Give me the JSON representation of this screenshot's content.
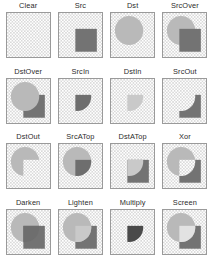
{
  "figure": {
    "columns": 4,
    "rows": 4,
    "colors": {
      "destination_shape": "#b9b9b9",
      "source_shape": "#737373",
      "intersection_dark": "#6e6e6e",
      "intersection_light": "#c9c9c9",
      "multiply_dark": "#4a4a4a",
      "screen_light": "#e2e2e2",
      "checker_light": "#ffffff",
      "checker_dark": "#d9d9d9",
      "cell_border": "#9a9a9a",
      "label_text": "#2b2b2b",
      "background": "#ffffff"
    },
    "geometry": {
      "destination_shape_kind": "circle",
      "destination_cx_pct": 42,
      "destination_cy_pct": 40,
      "destination_r_pct": 33,
      "source_shape_kind": "rect",
      "source_x_pct": 38,
      "source_y_pct": 36,
      "source_w_pct": 50,
      "source_h_pct": 52
    },
    "cells": [
      {
        "label": "Clear",
        "mode": "clear",
        "row": 1,
        "col": 1
      },
      {
        "label": "Src",
        "mode": "src",
        "row": 1,
        "col": 2
      },
      {
        "label": "Dst",
        "mode": "dst",
        "row": 1,
        "col": 3
      },
      {
        "label": "SrcOver",
        "mode": "src-over",
        "row": 1,
        "col": 4
      },
      {
        "label": "DstOver",
        "mode": "dst-over",
        "row": 2,
        "col": 1
      },
      {
        "label": "SrcIn",
        "mode": "src-in",
        "row": 2,
        "col": 2
      },
      {
        "label": "DstIn",
        "mode": "dst-in",
        "row": 2,
        "col": 3
      },
      {
        "label": "SrcOut",
        "mode": "src-out",
        "row": 2,
        "col": 4
      },
      {
        "label": "DstOut",
        "mode": "dst-out",
        "row": 3,
        "col": 1
      },
      {
        "label": "SrcATop",
        "mode": "src-atop",
        "row": 3,
        "col": 2
      },
      {
        "label": "DstATop",
        "mode": "dst-atop",
        "row": 3,
        "col": 3
      },
      {
        "label": "Xor",
        "mode": "xor",
        "row": 3,
        "col": 4
      },
      {
        "label": "Darken",
        "mode": "darken",
        "row": 4,
        "col": 1
      },
      {
        "label": "Lighten",
        "mode": "lighten",
        "row": 4,
        "col": 2
      },
      {
        "label": "Multiply",
        "mode": "multiply",
        "row": 4,
        "col": 3
      },
      {
        "label": "Screen",
        "mode": "screen",
        "row": 4,
        "col": 4
      }
    ]
  }
}
